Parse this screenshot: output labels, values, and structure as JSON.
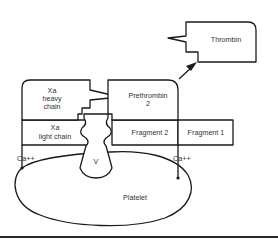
{
  "diagram": {
    "nodes": {
      "thrombin": {
        "label": "Thrombin"
      },
      "prethrombin": {
        "line1": "Prethrombin",
        "line2": "2"
      },
      "xa_heavy": {
        "line1": "Xa",
        "line2": "heavy",
        "line3": "chain"
      },
      "xa_light": {
        "line1": "Xa",
        "line2": "light chain"
      },
      "fragment2": {
        "label": "Fragment 2"
      },
      "fragment1": {
        "label": "Fragment 1"
      },
      "factor_v": {
        "label": "V"
      },
      "platelet": {
        "label": "Platelet"
      },
      "calcium_left": {
        "label": "Ca++"
      },
      "calcium_right": {
        "label": "Ca++"
      }
    },
    "edges": [
      {
        "from": "prethrombin",
        "to": "thrombin",
        "style": "arrow"
      }
    ],
    "colors": {
      "stroke": "#1a1a1a",
      "text": "#333333",
      "background": "#ffffff"
    }
  }
}
